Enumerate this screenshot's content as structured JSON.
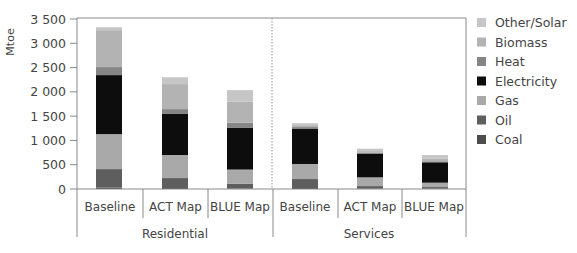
{
  "chart_data": {
    "type": "bar",
    "stacked": true,
    "title": "",
    "xlabel": "",
    "ylabel": "Mtoe",
    "ylim": [
      0,
      3500
    ],
    "yticks": [
      0,
      500,
      1000,
      1500,
      2000,
      2500,
      3000,
      3500
    ],
    "ytick_labels": [
      "0",
      "500",
      "1 000",
      "1 500",
      "2 000",
      "2 500",
      "3 000",
      "3 500"
    ],
    "grid": false,
    "legend_position": "right",
    "groups": [
      {
        "name": "Residential",
        "categories": [
          "Baseline",
          "ACT Map",
          "BLUE Map"
        ]
      },
      {
        "name": "Services",
        "categories": [
          "Baseline",
          "ACT Map",
          "BLUE Map"
        ]
      }
    ],
    "categories": [
      "Residential Baseline",
      "Residential ACT Map",
      "Residential BLUE Map",
      "Services Baseline",
      "Services ACT Map",
      "Services BLUE Map"
    ],
    "series": [
      {
        "name": "Coal",
        "color": "#4d4d4d",
        "values": [
          30,
          20,
          10,
          20,
          5,
          5
        ]
      },
      {
        "name": "Oil",
        "color": "#5e5e5e",
        "values": [
          380,
          205,
          100,
          185,
          55,
          35
        ]
      },
      {
        "name": "Gas",
        "color": "#a9a9a9",
        "values": [
          720,
          475,
          290,
          310,
          180,
          90
        ]
      },
      {
        "name": "Electricity",
        "color": "#0d0d0d",
        "values": [
          1215,
          845,
          865,
          720,
          490,
          420
        ]
      },
      {
        "name": "Heat",
        "color": "#858585",
        "values": [
          165,
          100,
          100,
          40,
          20,
          20
        ]
      },
      {
        "name": "Biomass",
        "color": "#b3b3b3",
        "values": [
          760,
          515,
          430,
          40,
          30,
          60
        ]
      },
      {
        "name": "Other/Solar",
        "color": "#c6c6c6",
        "values": [
          60,
          140,
          240,
          40,
          50,
          70
        ]
      }
    ],
    "legend_order": [
      "Other/Solar",
      "Biomass",
      "Heat",
      "Electricity",
      "Gas",
      "Oil",
      "Coal"
    ]
  }
}
